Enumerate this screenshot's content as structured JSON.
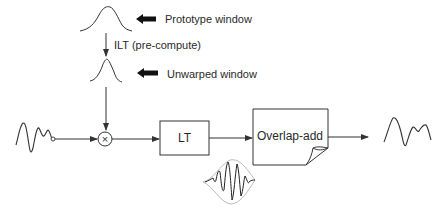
{
  "diagram": {
    "labels": {
      "prototype_window": "Prototype window",
      "ilt": "ILT (pre-compute)",
      "unwarped_window": "Unwarped window"
    },
    "blocks": {
      "lt": "LT",
      "overlap_add": "Overlap-add"
    },
    "operators": {
      "multiply": "×"
    },
    "colors": {
      "stroke": "#333333",
      "envelope": "#aaaaaa",
      "background": "#ffffff"
    }
  }
}
